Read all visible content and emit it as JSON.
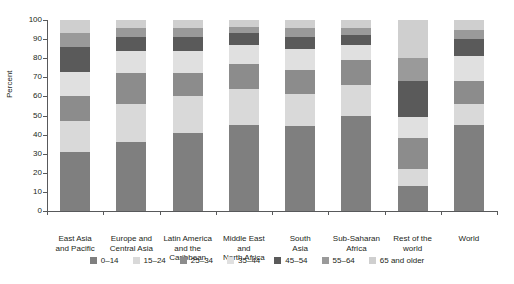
{
  "chart_data": {
    "type": "bar",
    "subtype": "stacked-100-percent",
    "title": "",
    "xlabel": "",
    "ylabel": "Percent",
    "ylim": [
      0,
      100
    ],
    "yticks": [
      0,
      10,
      20,
      30,
      40,
      50,
      60,
      70,
      80,
      90,
      100
    ],
    "ytick_labels": [
      "0",
      "10",
      "20",
      "30",
      "40",
      "50",
      "60",
      "70",
      "80",
      "90",
      "100"
    ],
    "grid": false,
    "legend_position": "bottom",
    "categories": [
      "East Asia and Pacific",
      "Europe and Central Asia",
      "Latin America and the Caribbean",
      "Middle East and North Africa",
      "South Asia",
      "Sub-Saharan Africa",
      "Rest of the world",
      "World"
    ],
    "category_label_lines": [
      [
        "East Asia",
        "and Pacific"
      ],
      [
        "Europe and",
        "Central Asia"
      ],
      [
        "Latin America",
        "and the",
        "Caribbean"
      ],
      [
        "Middle East",
        "and",
        "North Africa"
      ],
      [
        "South",
        "Asia"
      ],
      [
        "Sub-Saharan",
        "Africa"
      ],
      [
        "Rest of the",
        "world"
      ],
      [
        "World"
      ]
    ],
    "series": [
      {
        "name": "0–14",
        "color": "#7f7f7f",
        "values": [
          31.0,
          36.0,
          41.0,
          45.0,
          44.5,
          49.5,
          13.0,
          45.0
        ]
      },
      {
        "name": "15–24",
        "color": "#d9d9d9",
        "values": [
          16.0,
          20.0,
          19.0,
          19.0,
          16.5,
          16.5,
          9.0,
          11.0
        ]
      },
      {
        "name": "25–34",
        "color": "#8c8c8c",
        "values": [
          13.0,
          16.0,
          12.0,
          13.0,
          13.0,
          13.0,
          16.0,
          12.0
        ]
      },
      {
        "name": "35–44",
        "color": "#e0e0e0",
        "values": [
          13.0,
          12.0,
          12.0,
          10.0,
          11.0,
          8.0,
          11.0,
          13.0
        ]
      },
      {
        "name": "45–54",
        "color": "#5a5a5a",
        "values": [
          13.0,
          7.0,
          7.0,
          6.0,
          6.0,
          5.0,
          19.0,
          9.0
        ]
      },
      {
        "name": "55–64",
        "color": "#9a9a9a",
        "values": [
          7.0,
          5.0,
          5.0,
          3.5,
          5.0,
          4.0,
          12.0,
          5.0
        ]
      },
      {
        "name": "65 and older",
        "color": "#cfcfcf",
        "values": [
          7.0,
          4.0,
          4.0,
          3.5,
          4.0,
          4.0,
          20.0,
          5.0
        ]
      }
    ]
  },
  "axis": {
    "y_title": "Percent"
  },
  "legend": {
    "items": [
      "0–14",
      "15–24",
      "25–34",
      "35–44",
      "45–54",
      "55–64",
      "65 and older"
    ]
  },
  "header": {
    "title_clipped": ""
  }
}
